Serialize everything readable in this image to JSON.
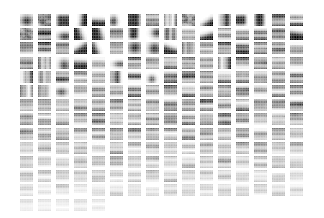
{
  "figure": {
    "title": "",
    "type": "feature-dictionary-grid",
    "background_color": "#ffffff",
    "colormap": "grayscale"
  },
  "grid": {
    "columns": 16,
    "rows": 14,
    "patch_width_px": 13,
    "patch_height_px": 12,
    "column_pitch_px": 18,
    "row_pitch_px": 14.2,
    "origin_x_px": 20,
    "origin_y_px": 14,
    "total_patches": 213,
    "last_row_patch_count": 5
  },
  "chart_data": {
    "type": "heatmap",
    "title": "",
    "xlabel": "",
    "ylabel": "",
    "grid": false,
    "legend": "none",
    "colormap": "gray_r",
    "value_range": [
      0,
      1
    ],
    "patch_pixels": [
      8,
      8
    ],
    "note": "Each cell is an independent 8x8 grayscale feature map; intensity fades with row index",
    "row_intensity": [
      1.0,
      0.97,
      0.94,
      0.9,
      0.86,
      0.81,
      0.76,
      0.7,
      0.63,
      0.56,
      0.48,
      0.39,
      0.29,
      0.18
    ],
    "patch_kinds": [
      [
        "blob-dark-top",
        "bar-h-dark",
        "block-dark",
        "edge-diag-tl",
        "edge-diag-tr",
        "blob-dark",
        "block-dark",
        "bar-h-thin",
        "bar-v-left",
        "bar-v-dark",
        "edge-diag-tr",
        "bar-v-thin",
        "block-dark-mid",
        "block-dark",
        "bar-h-thin",
        "bar-h-thin"
      ],
      [
        "bar-h-top",
        "bar-h-stack",
        "blob-corner",
        "edge-diag",
        "edge-diag-tr",
        "bar-h-stack",
        "block-dark",
        "blob-left",
        "bar-v-left",
        "bar-h-stack",
        "edge-diag",
        "bar-h-stack",
        "bar-h-stack",
        "bar-h-stack",
        "bar-h-edge",
        "edge-diag-tr"
      ],
      [
        "bar-h-thin",
        "bar-h-stack",
        "bar-h-stack",
        "edge-zigzag",
        "edge-diag-tr",
        "bar-h-edge",
        "blob-dark",
        "blob-dark",
        "edge-diag",
        "bar-v-left",
        "bar-h-stack",
        "bar-h-stack",
        "bar-h-stack",
        "bar-h-edge",
        "bar-h-edge",
        "bar-h-stack"
      ],
      [
        "bar-h-edge",
        "bar-v-left",
        "blob-corner",
        "edge-diag",
        "bar-h-stack",
        "blob-dark",
        "bar-h-edge",
        "bar-h-stack",
        "bar-h-stack",
        "bar-h-stack",
        "bar-h-stack",
        "bar-v-left",
        "bar-h-edge",
        "bar-h-stack",
        "bar-h-stack",
        "bar-h-stack"
      ],
      [
        "bar-v-thin",
        "bar-v-left",
        "bar-h-stack",
        "bar-h-stack",
        "bar-h-stack",
        "bar-v-two",
        "bar-h-edge",
        "blob-dark",
        "bar-h-stack",
        "bar-h-stack",
        "bar-h-stack",
        "bar-h-stack",
        "bar-h-stack",
        "bar-h-stack",
        "bar-h-stack",
        "bar-h-stack"
      ],
      [
        "bar-v-two",
        "bar-v-left",
        "blob-corner",
        "bar-h-stack",
        "bar-h-stack",
        "bar-h-stack",
        "bar-h-edge",
        "bar-h-stack",
        "bar-h-stack",
        "bar-h-stack",
        "bar-h-stack",
        "bar-h-stack",
        "bar-h-stack",
        "bar-h-stack",
        "bar-h-stack",
        "bar-h-stack"
      ],
      [
        "bar-h-stack",
        "bar-h-stack",
        "bar-h-stack",
        "bar-h-stack",
        "bar-h-stack",
        "bar-h-stack",
        "bar-h-stack",
        "bar-h-stack",
        "bar-h-stack",
        "bar-h-stack",
        "bar-h-stack",
        "bar-h-stack",
        "bar-h-stack",
        "bar-h-stack",
        "bar-h-stack",
        "bar-h-stack"
      ],
      [
        "bar-h-stack",
        "bar-h-stack",
        "bar-h-stack",
        "bar-h-stack",
        "bar-h-stack",
        "bar-h-stack",
        "bar-h-stack",
        "bar-h-stack",
        "bar-h-stack",
        "bar-h-stack",
        "bar-h-stack",
        "bar-h-stack",
        "bar-h-stack",
        "bar-h-stack",
        "bar-h-stack",
        "bar-h-stack"
      ],
      [
        "bar-h-stack",
        "bar-h-stack",
        "bar-h-stack",
        "bar-h-stack",
        "bar-h-stack",
        "bar-h-stack",
        "bar-h-stack",
        "bar-h-stack",
        "bar-h-stack",
        "bar-h-stack",
        "bar-h-stack",
        "bar-h-stack",
        "bar-h-stack",
        "bar-h-stack",
        "bar-h-stack",
        "bar-h-stack"
      ],
      [
        "bar-h-stack",
        "bar-h-stack",
        "bar-h-stack",
        "bar-h-stack",
        "bar-h-stack",
        "bar-h-stack",
        "bar-h-stack",
        "bar-h-stack",
        "bar-h-stack",
        "bar-h-stack",
        "bar-h-stack",
        "bar-h-stack",
        "bar-h-stack",
        "bar-h-stack",
        "bar-h-stack",
        "bar-h-stack"
      ],
      [
        "bar-h-stack",
        "bar-h-stack",
        "bar-h-stack",
        "bar-h-stack",
        "bar-h-stack",
        "bar-h-stack",
        "bar-h-stack",
        "bar-h-stack",
        "bar-h-stack",
        "bar-h-stack",
        "bar-h-stack",
        "bar-h-stack",
        "bar-h-stack",
        "bar-h-stack",
        "bar-h-stack",
        "bar-h-stack"
      ],
      [
        "bar-h-stack",
        "bar-h-stack",
        "bar-h-stack",
        "bar-h-stack",
        "bar-h-stack",
        "bar-h-stack",
        "bar-h-stack",
        "bar-h-stack",
        "bar-h-stack",
        "bar-h-stack",
        "bar-h-stack",
        "bar-h-stack",
        "bar-h-stack",
        "bar-h-stack",
        "bar-h-stack",
        "bar-h-stack"
      ],
      [
        "bar-h-stack",
        "bar-h-stack",
        "bar-h-stack",
        "bar-h-stack",
        "bar-h-stack",
        "bar-h-stack",
        "bar-h-stack",
        "bar-h-stack",
        "bar-h-stack",
        "bar-h-stack",
        "bar-h-stack",
        "bar-h-stack",
        "bar-h-stack",
        "bar-h-stack",
        "bar-h-stack",
        "bar-h-stack"
      ],
      [
        "bar-h-stack",
        "bar-h-stack",
        "bar-h-stack",
        "bar-h-stack",
        "bar-h-stack"
      ]
    ]
  }
}
